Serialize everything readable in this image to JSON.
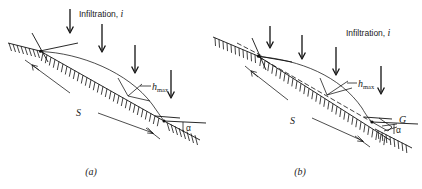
{
  "figure": {
    "kind": "engineering-diagram",
    "line_color": "#111111",
    "background_color": "#ffffff"
  },
  "panels": [
    {
      "id": "a",
      "caption": "(a)",
      "infiltration_label": "Infiltration, i",
      "infiltration_label_italic_part": "i",
      "arrow_count": 4,
      "labels": {
        "slope_length": "S",
        "max_head": "h",
        "max_head_subscript": "max",
        "slope_angle": "α"
      }
    },
    {
      "id": "b",
      "caption": "(b)",
      "infiltration_label": "Infiltration, i",
      "infiltration_label_italic_part": "i",
      "arrow_count": 4,
      "labels": {
        "slope_length": "S",
        "max_head": "h",
        "max_head_subscript": "max",
        "slope_angle": "α",
        "toe_drain": "G"
      }
    }
  ]
}
